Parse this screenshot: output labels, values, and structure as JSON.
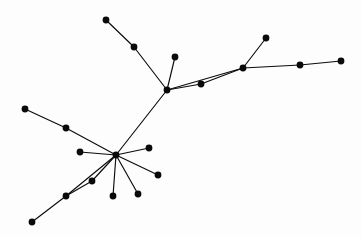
{
  "figure": {
    "title": "",
    "kind": "node-link-graph",
    "background_color": "#fdfdfd",
    "node_color": "#0a0a0a",
    "edge_color": "#0b0b0b",
    "node_radius": 3.4,
    "edge_width": 1.15,
    "width": 362,
    "height": 237
  },
  "chart_data": {
    "type": "scatter",
    "title": "",
    "xlabel": "",
    "ylabel": "",
    "xlim": [
      0,
      362
    ],
    "ylim": [
      0,
      237
    ],
    "grid": false,
    "legend": "none",
    "nodes": [
      {
        "id": "n0",
        "label": "",
        "x": 106,
        "y": 20
      },
      {
        "id": "n1",
        "label": "",
        "x": 134,
        "y": 47
      },
      {
        "id": "n2",
        "label": "",
        "x": 175,
        "y": 57
      },
      {
        "id": "n3",
        "label": "",
        "x": 167,
        "y": 90
      },
      {
        "id": "n4",
        "label": "",
        "x": 201,
        "y": 84
      },
      {
        "id": "n5",
        "label": "",
        "x": 243,
        "y": 68
      },
      {
        "id": "n6",
        "label": "",
        "x": 266,
        "y": 38
      },
      {
        "id": "n7",
        "label": "",
        "x": 300,
        "y": 65
      },
      {
        "id": "n8",
        "label": "",
        "x": 341,
        "y": 61
      },
      {
        "id": "n9",
        "label": "",
        "x": 116,
        "y": 155
      },
      {
        "id": "n10",
        "label": "",
        "x": 80,
        "y": 152
      },
      {
        "id": "n11",
        "label": "",
        "x": 66,
        "y": 128
      },
      {
        "id": "n12",
        "label": "",
        "x": 25,
        "y": 109
      },
      {
        "id": "n13",
        "label": "",
        "x": 149,
        "y": 148
      },
      {
        "id": "n14",
        "label": "",
        "x": 158,
        "y": 175
      },
      {
        "id": "n15",
        "label": "",
        "x": 138,
        "y": 194
      },
      {
        "id": "n16",
        "label": "",
        "x": 113,
        "y": 196
      },
      {
        "id": "n17",
        "label": "",
        "x": 92,
        "y": 181
      },
      {
        "id": "n18",
        "label": "",
        "x": 66,
        "y": 196
      },
      {
        "id": "n19",
        "label": "",
        "x": 32,
        "y": 222
      }
    ],
    "edges": [
      {
        "source": "n0",
        "target": "n1"
      },
      {
        "source": "n1",
        "target": "n3"
      },
      {
        "source": "n2",
        "target": "n3"
      },
      {
        "source": "n3",
        "target": "n4"
      },
      {
        "source": "n3",
        "target": "n5"
      },
      {
        "source": "n4",
        "target": "n5"
      },
      {
        "source": "n5",
        "target": "n6"
      },
      {
        "source": "n5",
        "target": "n7"
      },
      {
        "source": "n7",
        "target": "n8"
      },
      {
        "source": "n3",
        "target": "n9"
      },
      {
        "source": "n9",
        "target": "n10"
      },
      {
        "source": "n11",
        "target": "n9"
      },
      {
        "source": "n12",
        "target": "n11"
      },
      {
        "source": "n9",
        "target": "n13"
      },
      {
        "source": "n9",
        "target": "n14"
      },
      {
        "source": "n9",
        "target": "n15"
      },
      {
        "source": "n9",
        "target": "n16"
      },
      {
        "source": "n9",
        "target": "n17"
      },
      {
        "source": "n9",
        "target": "n18"
      },
      {
        "source": "n18",
        "target": "n19"
      },
      {
        "source": "n17",
        "target": "n18"
      }
    ]
  }
}
